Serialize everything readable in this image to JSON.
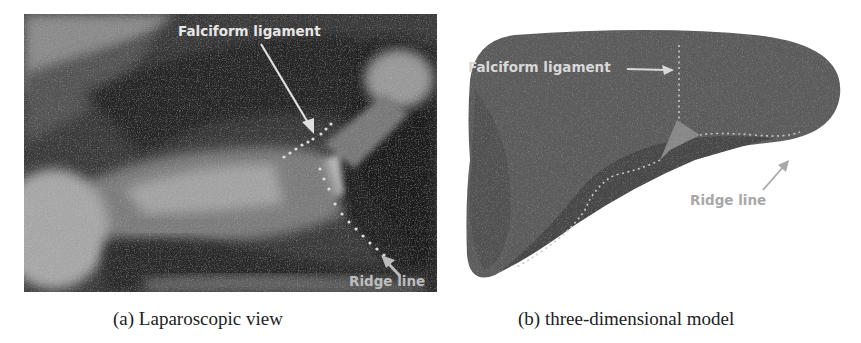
{
  "figure": {
    "subfigures": [
      {
        "id": "a",
        "caption": "(a) Laparoscopic view",
        "image_kind": "grayscale laparoscopic photograph",
        "annotations": [
          {
            "text": "Falciform ligament",
            "color": "#e6e6e6"
          },
          {
            "text": "Ridge line",
            "color": "#bdbdbd"
          }
        ]
      },
      {
        "id": "b",
        "caption": "(b) three-dimensional model",
        "image_kind": "3D liver surface model",
        "annotations": [
          {
            "text": "Falciform ligament",
            "color": "#d8d8d8"
          },
          {
            "text": "Ridge line",
            "color": "#a8a8a8"
          }
        ],
        "colors": {
          "surface": "#5c5c5c",
          "underside": "#4a4a4a",
          "ligament_patch": "#8a8a8a",
          "dotted_line": "#c8c8c8"
        }
      }
    ]
  }
}
